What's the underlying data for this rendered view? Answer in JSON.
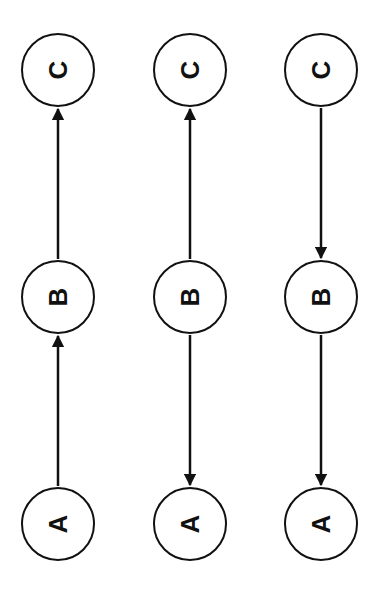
{
  "diagram": {
    "stroke_color": "#111111",
    "background": "#ffffff",
    "columns": [
      {
        "name": "chain-1",
        "nodes": [
          {
            "label": "C",
            "cx": 58,
            "cy": 70
          },
          {
            "label": "B",
            "cx": 58,
            "cy": 297
          },
          {
            "label": "A",
            "cx": 58,
            "cy": 524
          }
        ],
        "edges": [
          {
            "from": "B",
            "to": "C",
            "direction": "up"
          },
          {
            "from": "A",
            "to": "B",
            "direction": "up"
          }
        ]
      },
      {
        "name": "chain-2",
        "nodes": [
          {
            "label": "C",
            "cx": 190,
            "cy": 70
          },
          {
            "label": "B",
            "cx": 190,
            "cy": 297
          },
          {
            "label": "A",
            "cx": 190,
            "cy": 524
          }
        ],
        "edges": [
          {
            "from": "B",
            "to": "C",
            "direction": "up"
          },
          {
            "from": "B",
            "to": "A",
            "direction": "down"
          }
        ]
      },
      {
        "name": "chain-3",
        "nodes": [
          {
            "label": "C",
            "cx": 321,
            "cy": 70
          },
          {
            "label": "B",
            "cx": 321,
            "cy": 297
          },
          {
            "label": "A",
            "cx": 321,
            "cy": 524
          }
        ],
        "edges": [
          {
            "from": "C",
            "to": "B",
            "direction": "down"
          },
          {
            "from": "B",
            "to": "A",
            "direction": "down"
          }
        ]
      }
    ]
  }
}
